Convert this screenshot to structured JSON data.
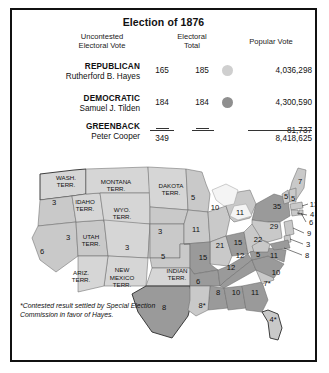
{
  "figure": {
    "title": "Election of 1876",
    "columns": {
      "party": "",
      "uncontested": "Uncontested\nElectoral Vote",
      "uncontested_l1": "Uncontested",
      "uncontested_l2": "Electoral Vote",
      "electoral_total_l1": "Electoral",
      "electoral_total_l2": "Total",
      "popular": "Popular Vote"
    },
    "rows": [
      {
        "party": "REPUBLICAN",
        "candidate": "Rutherford B. Hayes",
        "uncontested": "165",
        "electoral_total": "185",
        "swatch_color": "#cfcfcf",
        "popular_vote": "4,036,298"
      },
      {
        "party": "DEMOCRATIC",
        "candidate": "Samuel J. Tilden",
        "uncontested": "184",
        "electoral_total": "184",
        "swatch_color": "#8f8f8f",
        "popular_vote": "4,300,590"
      },
      {
        "party": "GREENBACK",
        "candidate": "Peter Cooper",
        "uncontested": "—",
        "electoral_total": "—",
        "swatch_color": "transparent",
        "popular_vote": "81,737"
      }
    ],
    "totals": {
      "uncontested": "349",
      "popular_vote": "8,418,625"
    },
    "footnote": "*Contested result settled by Special Election Commission in favor of Hayes."
  },
  "map": {
    "territory_labels": [
      {
        "name": "washington-territory",
        "lines": [
          "WASH.",
          "TERR."
        ],
        "x": 54,
        "y": 22
      },
      {
        "name": "montana-territory",
        "lines": [
          "MONTANA",
          "TERR."
        ],
        "x": 104,
        "y": 26
      },
      {
        "name": "dakota-territory",
        "lines": [
          "DAKOTA",
          "TERR."
        ],
        "x": 159,
        "y": 30
      },
      {
        "name": "idaho-territory",
        "lines": [
          "IDAHO",
          "TERR."
        ],
        "x": 73,
        "y": 46
      },
      {
        "name": "wyoming-territory",
        "lines": [
          "WYO.",
          "TERR."
        ],
        "x": 110,
        "y": 54
      },
      {
        "name": "utah-territory",
        "lines": [
          "UTAH",
          "TERR."
        ],
        "x": 79,
        "y": 81
      },
      {
        "name": "arizona-territory",
        "lines": [
          "ARIZ.",
          "TERR."
        ],
        "x": 69,
        "y": 117
      },
      {
        "name": "new-mexico-territory",
        "lines": [
          "NEW",
          "MEXICO",
          "TERR."
        ],
        "x": 110,
        "y": 118
      },
      {
        "name": "indian-territory",
        "lines": [
          "INDIAN",
          "TERR."
        ],
        "x": 165,
        "y": 115
      }
    ],
    "state_votes": [
      {
        "state": "oregon",
        "value": "3",
        "x": 42,
        "y": 43,
        "party": "republican"
      },
      {
        "state": "california",
        "value": "6",
        "x": 30,
        "y": 92,
        "party": "republican"
      },
      {
        "state": "nevada",
        "value": "3",
        "x": 56,
        "y": 78,
        "party": "republican"
      },
      {
        "state": "colorado",
        "value": "3",
        "x": 115,
        "y": 88,
        "party": "republican"
      },
      {
        "state": "nebraska",
        "value": "3",
        "x": 148,
        "y": 72,
        "party": "republican"
      },
      {
        "state": "kansas",
        "value": "5",
        "x": 151,
        "y": 97,
        "party": "republican"
      },
      {
        "state": "minnesota",
        "value": "5",
        "x": 181,
        "y": 38,
        "party": "republican"
      },
      {
        "state": "iowa",
        "value": "11",
        "x": 184,
        "y": 70,
        "party": "republican"
      },
      {
        "state": "missouri",
        "value": "15",
        "x": 191,
        "y": 98,
        "party": "democratic"
      },
      {
        "state": "wisconsin",
        "value": "10",
        "x": 203,
        "y": 48,
        "party": "republican"
      },
      {
        "state": "michigan",
        "value": "11",
        "x": 228,
        "y": 53,
        "party": "republican"
      },
      {
        "state": "illinois",
        "value": "21",
        "x": 208,
        "y": 86,
        "party": "republican"
      },
      {
        "state": "indiana",
        "value": "15",
        "x": 226,
        "y": 83,
        "party": "democratic"
      },
      {
        "state": "ohio",
        "value": "22",
        "x": 246,
        "y": 80,
        "party": "republican"
      },
      {
        "state": "texas",
        "value": "8",
        "x": 152,
        "y": 148,
        "party": "democratic"
      },
      {
        "state": "arkansas",
        "value": "6",
        "x": 186,
        "y": 122,
        "party": "democratic"
      },
      {
        "state": "louisiana",
        "value": "8*",
        "x": 190,
        "y": 146,
        "party": "republican"
      },
      {
        "state": "mississippi",
        "value": "8",
        "x": 206,
        "y": 133,
        "party": "democratic"
      },
      {
        "state": "alabama",
        "value": "10",
        "x": 224,
        "y": 133,
        "party": "democratic"
      },
      {
        "state": "georgia",
        "value": "11",
        "x": 243,
        "y": 133,
        "party": "democratic"
      },
      {
        "state": "florida",
        "value": "4*",
        "x": 261,
        "y": 160,
        "party": "republican"
      },
      {
        "state": "tennessee",
        "value": "12",
        "x": 219,
        "y": 108,
        "party": "democratic"
      },
      {
        "state": "kentucky",
        "value": "12",
        "x": 228,
        "y": 96,
        "party": "democratic"
      },
      {
        "state": "west-virginia",
        "value": "5",
        "x": 246,
        "y": 95,
        "party": "republican"
      },
      {
        "state": "virginia",
        "value": "11",
        "x": 262,
        "y": 96,
        "party": "democratic"
      },
      {
        "state": "north-carolina",
        "value": "10",
        "x": 264,
        "y": 113,
        "party": "democratic"
      },
      {
        "state": "south-carolina",
        "value": "7*",
        "x": 255,
        "y": 124,
        "party": "republican"
      },
      {
        "state": "pennsylvania",
        "value": "29",
        "x": 262,
        "y": 67,
        "party": "republican"
      },
      {
        "state": "new-york",
        "value": "35",
        "x": 265,
        "y": 47,
        "party": "democratic"
      },
      {
        "state": "maine",
        "value": "7",
        "x": 288,
        "y": 22,
        "party": "republican"
      },
      {
        "state": "vermont",
        "value": "5",
        "x": 274,
        "y": 37,
        "party": "republican"
      },
      {
        "state": "new-hampshire",
        "value": "5",
        "x": 281,
        "y": 39,
        "party": "republican"
      }
    ],
    "leader_votes": [
      {
        "state": "massachusetts",
        "value": "13",
        "x": 302,
        "y": 45
      },
      {
        "state": "connecticut",
        "value": "4",
        "x": 300,
        "y": 55
      },
      {
        "state": "rhode-island",
        "value": "6",
        "x": 299,
        "y": 63
      },
      {
        "state": "new-jersey",
        "value": "9",
        "x": 297,
        "y": 74
      },
      {
        "state": "delaware",
        "value": "3",
        "x": 296,
        "y": 85
      },
      {
        "state": "maryland",
        "value": "8",
        "x": 295,
        "y": 96
      }
    ],
    "colors": {
      "republican": "#c9c9c9",
      "democratic": "#9a9a9a",
      "territory": "#d6d6d6",
      "water": "#ffffff",
      "border": "#6d6d6d"
    }
  }
}
